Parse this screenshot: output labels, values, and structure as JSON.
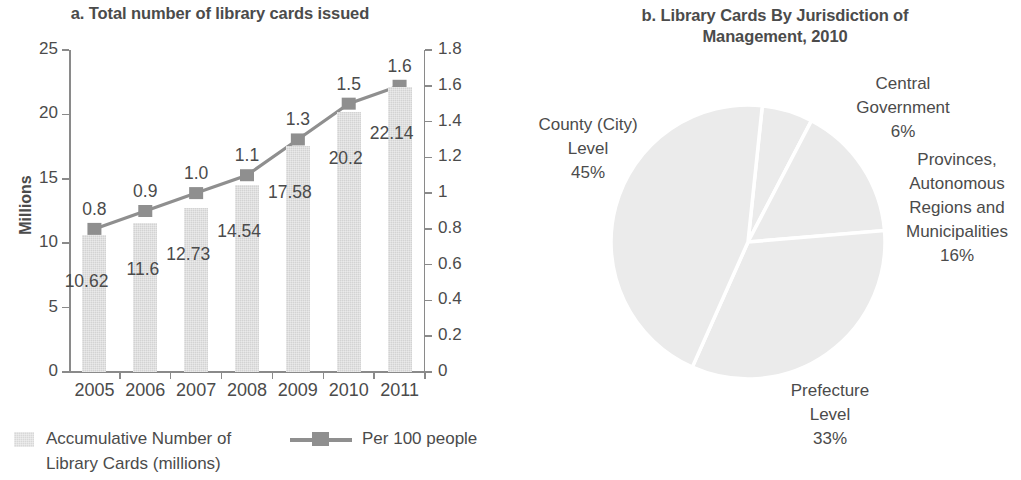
{
  "panel_a": {
    "title": "a. Total number of library cards issued",
    "y_axis_title": "Millions",
    "left_axis_ticks": [
      "25",
      "20",
      "15",
      "10",
      "5",
      "0"
    ],
    "right_axis_ticks": [
      "1.8",
      "1.6",
      "1.4",
      "1.2",
      "1",
      "0.8",
      "0.6",
      "0.4",
      "0.2",
      "0"
    ],
    "legend": {
      "bars_label": "Accumulative Number of Library Cards (millions)",
      "line_label": "Per 100 people"
    }
  },
  "panel_b": {
    "title": "b. Library Cards By Jurisdiction of Management, 2010",
    "labels": {
      "county": "County (City)\nLevel\n45%",
      "central": "Central\nGovernment\n6%",
      "provinces": "Provinces,\nAutonomous\nRegions and\nMunicipalities\n16%",
      "prefecture": "Prefecture\nLevel\n33%"
    }
  },
  "colors": {
    "bar_fill": "#d3d3d3",
    "line": "#8f8f8f",
    "text": "#4b4b4b",
    "axis": "#8a8a8a",
    "pie_fill": "#ebebeb",
    "pie_divider": "#ffffff"
  },
  "chart_data": [
    {
      "type": "bar",
      "title": "a. Total number of library cards issued",
      "xlabel": "",
      "ylabel": "Millions",
      "y2label": "",
      "categories": [
        "2005",
        "2006",
        "2007",
        "2008",
        "2009",
        "2010",
        "2011"
      ],
      "ylim": [
        0,
        25
      ],
      "y2lim": [
        0,
        1.8
      ],
      "grid": false,
      "legend_position": "bottom",
      "series": [
        {
          "name": "Accumulative Number of Library Cards (millions)",
          "type": "bar",
          "axis": "left",
          "values": [
            10.62,
            11.6,
            12.73,
            14.54,
            17.58,
            20.2,
            22.14
          ],
          "labels": [
            "10.62",
            "11.6",
            "12.73",
            "14.54",
            "17.58",
            "20.2",
            "22.14"
          ]
        },
        {
          "name": "Per 100 people",
          "type": "line",
          "axis": "right",
          "values": [
            0.8,
            0.9,
            1.0,
            1.1,
            1.3,
            1.5,
            1.6
          ],
          "labels": [
            "0.8",
            "0.9",
            "1.0",
            "1.1",
            "1.3",
            "1.5",
            "1.6"
          ]
        }
      ]
    },
    {
      "type": "pie",
      "title": "b. Library Cards By Jurisdiction of Management, 2010",
      "categories": [
        "Central Government",
        "Provinces, Autonomous Regions and Municipalities",
        "Prefecture Level",
        "County (City) Level"
      ],
      "values": [
        6,
        16,
        33,
        45
      ],
      "value_labels": [
        "6%",
        "16%",
        "33%",
        "45%"
      ],
      "units": "percent",
      "legend_position": "outside-labels"
    }
  ]
}
